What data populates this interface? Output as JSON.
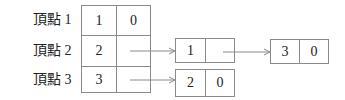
{
  "diagram": {
    "type": "adjacency-list",
    "vertices": [
      {
        "label": "頂點 1",
        "id": "1",
        "link": "0"
      },
      {
        "label": "頂點 2",
        "id": "2",
        "link": ""
      },
      {
        "label": "頂點 3",
        "id": "3",
        "link": ""
      }
    ],
    "nodes": [
      {
        "value": "1",
        "next": "",
        "from": "頂點 2"
      },
      {
        "value": "3",
        "next": "0",
        "from": "node 1"
      },
      {
        "value": "2",
        "next": "0",
        "from": "頂點 3"
      }
    ],
    "colors": {
      "line": "#8a8a8a",
      "text": "#222222"
    }
  }
}
